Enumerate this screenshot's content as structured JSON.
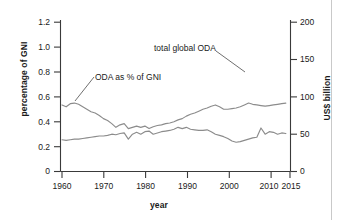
{
  "chart_data": {
    "type": "line",
    "title": "",
    "xlabel": "year",
    "ylabel": "percentage of GNI",
    "y2label": "US$ billion",
    "xlim": [
      1960,
      2015
    ],
    "ylim": [
      0,
      1.2
    ],
    "y2lim": [
      0,
      200
    ],
    "grid": false,
    "legend_position": "inline-annotations",
    "xticks": [
      1960,
      1970,
      1980,
      1990,
      2000,
      2010,
      2015
    ],
    "xticklabels": [
      "1960",
      "1970",
      "1980",
      "1990",
      "2000",
      "2010",
      "2015"
    ],
    "yticks": [
      0,
      0.2,
      0.4,
      0.6,
      0.8,
      1.0,
      1.2
    ],
    "yticklabels": [
      "0",
      "0.2",
      "0.4",
      "0.6",
      "0.8",
      "1.0",
      "1.2"
    ],
    "y2ticks": [
      0,
      50,
      100,
      150,
      200
    ],
    "y2ticklabels": [
      "0",
      "50",
      "100",
      "150",
      "200"
    ],
    "annotations": [
      {
        "text": "ODA as % of GNI",
        "x": 1964,
        "y": 0.72
      },
      {
        "text": "total global ODA",
        "x": 1988,
        "y": 0.98
      }
    ],
    "series": [
      {
        "name": "ODA as % of GNI",
        "axis": "left",
        "units": "percentage of GNI",
        "x": [
          1960,
          1961,
          1962,
          1963,
          1964,
          1965,
          1966,
          1967,
          1968,
          1969,
          1970,
          1971,
          1972,
          1973,
          1974,
          1975,
          1976,
          1977,
          1978,
          1979,
          1980,
          1981,
          1982,
          1983,
          1984,
          1985,
          1986,
          1987,
          1988,
          1989,
          1990,
          1991,
          1992,
          1993,
          1994,
          1995,
          1996,
          1997,
          1998,
          1999,
          2000,
          2001,
          2002,
          2003,
          2004,
          2005,
          2006,
          2007,
          2008,
          2009,
          2010,
          2011,
          2012,
          2013,
          2014
        ],
        "values": [
          0.54,
          0.53,
          0.545,
          0.55,
          0.535,
          0.52,
          0.5,
          0.48,
          0.46,
          0.44,
          0.42,
          0.4,
          0.385,
          0.36,
          0.37,
          0.38,
          0.345,
          0.35,
          0.36,
          0.355,
          0.36,
          0.345,
          0.355,
          0.365,
          0.375,
          0.38,
          0.385,
          0.395,
          0.41,
          0.42,
          0.44,
          0.455,
          0.465,
          0.48,
          0.495,
          0.505,
          0.52,
          0.535,
          0.52,
          0.5,
          0.5,
          0.5,
          0.51,
          0.52,
          0.53,
          0.545,
          0.54,
          0.535,
          0.53,
          0.525,
          0.53,
          0.535,
          0.54,
          0.545,
          0.55
        ]
      },
      {
        "name": "total global ODA",
        "axis": "right",
        "units": "US$ billion",
        "x": [
          1960,
          1961,
          1962,
          1963,
          1964,
          1965,
          1966,
          1967,
          1968,
          1969,
          1970,
          1971,
          1972,
          1973,
          1974,
          1975,
          1976,
          1977,
          1978,
          1979,
          1980,
          1981,
          1982,
          1983,
          1984,
          1985,
          1986,
          1987,
          1988,
          1989,
          1990,
          1991,
          1992,
          1993,
          1994,
          1995,
          1996,
          1997,
          1998,
          1999,
          2000,
          2001,
          2002,
          2003,
          2004,
          2005,
          2006,
          2007,
          2008,
          2009,
          2010,
          2011,
          2012,
          2013,
          2014
        ],
        "values": [
          39,
          40,
          41,
          41,
          42,
          43,
          43,
          44,
          44,
          45,
          46,
          47,
          48,
          47,
          48,
          50,
          49,
          51,
          54,
          55,
          56,
          54,
          55,
          56,
          57,
          58,
          59,
          60,
          62,
          60,
          61,
          62,
          62,
          60,
          61,
          59,
          55,
          51,
          54,
          57,
          54,
          54,
          58,
          69,
          80,
          108,
          105,
          104,
          122,
          120,
          128,
          126,
          126,
          135,
          137
        ]
      }
    ]
  },
  "series_left_render": {
    "values": [
      0.255,
      0.25,
      0.255,
      0.26,
      0.26,
      0.265,
      0.27,
      0.275,
      0.28,
      0.285,
      0.285,
      0.29,
      0.3,
      0.295,
      0.305,
      0.31,
      0.26,
      0.3,
      0.315,
      0.3,
      0.32,
      0.325,
      0.3,
      0.31,
      0.32,
      0.325,
      0.33,
      0.34,
      0.355,
      0.345,
      0.355,
      0.34,
      0.335,
      0.33,
      0.33,
      0.335,
      0.32,
      0.3,
      0.29,
      0.28,
      0.265,
      0.245,
      0.235,
      0.24,
      0.25,
      0.26,
      0.27,
      0.275,
      0.35,
      0.3,
      0.32,
      0.315,
      0.3,
      0.31,
      0.305
    ]
  },
  "series_right_render": {
    "values": [
      0.535,
      0.52,
      0.545,
      0.55,
      0.54,
      0.52,
      0.5,
      0.48,
      0.47,
      0.45,
      0.425,
      0.41,
      0.385,
      0.355,
      0.375,
      0.385,
      0.345,
      0.355,
      0.365,
      0.355,
      0.365,
      0.345,
      0.36,
      0.37,
      0.375,
      0.385,
      0.39,
      0.4,
      0.415,
      0.425,
      0.445,
      0.46,
      0.47,
      0.485,
      0.5,
      0.51,
      0.525,
      0.535,
      0.52,
      0.5,
      0.5,
      0.505,
      0.51,
      0.52,
      0.535,
      0.55,
      0.54,
      0.535,
      0.53,
      0.525,
      0.53,
      0.535,
      0.54,
      0.545,
      0.55
    ]
  },
  "axes": {
    "left": {
      "label": "percentage of GNI",
      "ticks": [
        "1.2",
        "1.0",
        "0.8",
        "0.6",
        "0.4",
        "0.2",
        "0"
      ]
    },
    "right": {
      "label": "US$ billion",
      "ticks": [
        "200",
        "150",
        "100",
        "50",
        "0"
      ]
    },
    "bottom": {
      "label": "year",
      "ticks": [
        "1960",
        "1970",
        "1980",
        "1990",
        "2000",
        "2010",
        "2015"
      ]
    }
  },
  "annotations": {
    "oda_gni": "ODA as % of GNI",
    "total_oda": "total global ODA"
  },
  "colors": {
    "line": "#8c8c8c",
    "axis": "#3a3a3a",
    "text": "#1a1a1a",
    "background": "#ffffff",
    "border": "#c9c9c9"
  }
}
